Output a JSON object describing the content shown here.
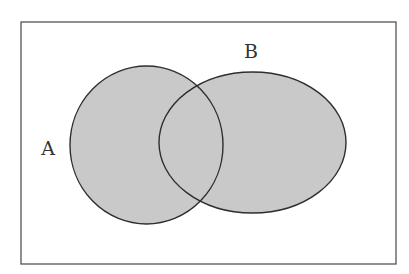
{
  "diagram": {
    "type": "venn",
    "universe": {
      "x": 21,
      "y": 22,
      "width": 375,
      "height": 242,
      "stroke": "#555555"
    },
    "style": {
      "fill": "#c9c9c9",
      "stroke": "#2e2e2e",
      "stroke_width": 1.4
    },
    "sets": [
      {
        "id": "A",
        "label": "A",
        "cx": 146.5,
        "cy": 145,
        "rx": 76.5,
        "ry": 79,
        "label_x": 48,
        "label_y": 155
      },
      {
        "id": "B",
        "label": "B",
        "cx": 252.5,
        "cy": 142.5,
        "rx": 93.5,
        "ry": 70.5,
        "label_x": 251,
        "label_y": 58
      }
    ],
    "shaded_region": "A ∪ B"
  }
}
